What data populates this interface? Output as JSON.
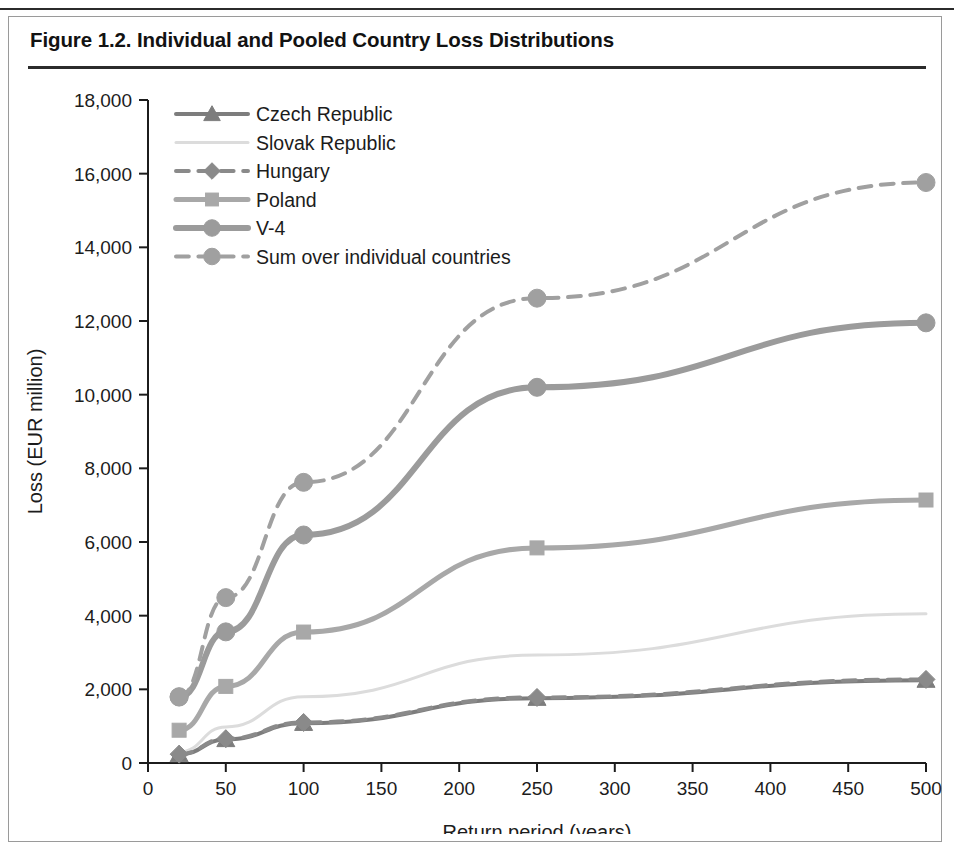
{
  "figure": {
    "title": "Figure 1.2. Individual and Pooled Country Loss Distributions"
  },
  "chart_data": {
    "type": "line",
    "title": "Figure 1.2. Individual and Pooled Country Loss Distributions",
    "xlabel": "Return period (years)",
    "ylabel": "Loss (EUR million)",
    "xlim": [
      0,
      500
    ],
    "ylim": [
      0,
      18000
    ],
    "xticks": [
      0,
      50,
      100,
      150,
      200,
      250,
      300,
      350,
      400,
      450,
      500
    ],
    "xticklabels": [
      "0",
      "50",
      "100",
      "150",
      "200",
      "250",
      "300",
      "350",
      "400",
      "450",
      "500"
    ],
    "yticks": [
      0,
      2000,
      4000,
      6000,
      8000,
      10000,
      12000,
      14000,
      16000,
      18000
    ],
    "yticklabels": [
      "0",
      "2,000",
      "4,000",
      "6,000",
      "8,000",
      "10,000",
      "12,000",
      "14,000",
      "16,000",
      "18,000"
    ],
    "grid": false,
    "legend_position": "upper left",
    "x": [
      20,
      50,
      100,
      250,
      500
    ],
    "series": [
      {
        "name": "Czech Republic",
        "values": [
          230,
          640,
          1080,
          1760,
          2250
        ],
        "color": "#7d7d7d",
        "marker": "triangle",
        "dash": "solid",
        "width": 4
      },
      {
        "name": "Slovak Republic",
        "values": [
          300,
          980,
          1800,
          2930,
          4050
        ],
        "color": "#dcdcdc",
        "marker": "none",
        "dash": "solid",
        "width": 3
      },
      {
        "name": "Hungary",
        "values": [
          240,
          660,
          1100,
          1780,
          2270
        ],
        "color": "#8a8a8a",
        "marker": "diamond",
        "dash": "dashed",
        "width": 4
      },
      {
        "name": "Poland",
        "values": [
          890,
          2080,
          3555,
          5840,
          7140
        ],
        "color": "#a8a8a8",
        "marker": "square",
        "dash": "solid",
        "width": 5
      },
      {
        "name": "V-4",
        "values": [
          1790,
          3560,
          6190,
          10200,
          11950
        ],
        "color": "#9b9b9b",
        "marker": "circle",
        "dash": "solid",
        "width": 6
      },
      {
        "name": "Sum over individual countries",
        "values": [
          1800,
          4490,
          7620,
          12620,
          15760
        ],
        "color": "#a0a0a0",
        "marker": "circle",
        "dash": "dashed",
        "width": 4
      }
    ]
  }
}
